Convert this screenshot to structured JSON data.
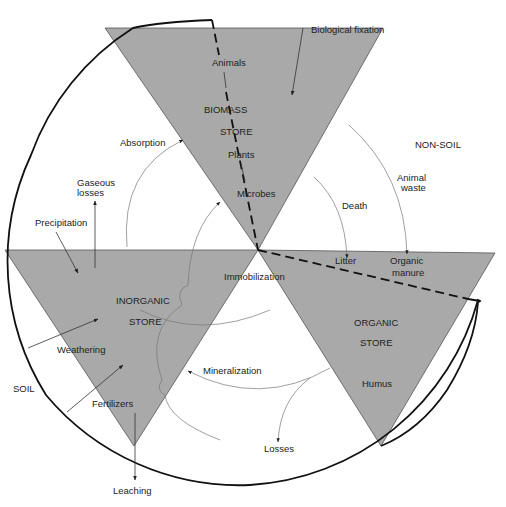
{
  "diagram": {
    "regions": {
      "soil": "SOIL",
      "non_soil": "NON-SOIL"
    },
    "stores": {
      "biomass": {
        "title_line1": "BIOMASS",
        "title_line2": "STORE",
        "components": [
          "Animals",
          "Plants",
          "Microbes"
        ]
      },
      "inorganic": {
        "title_line1": "INORGANIC",
        "title_line2": "STORE"
      },
      "organic": {
        "title_line1": "ORGANIC",
        "title_line2": "STORE",
        "components": [
          "Litter",
          "Organic",
          "manure",
          "Humus"
        ]
      }
    },
    "flows": {
      "biological_fixation": "Biological fixation",
      "absorption": "Absorption",
      "gaseous_losses_1": "Gaseous",
      "gaseous_losses_2": "losses",
      "precipitation": "Precipitation",
      "death": "Death",
      "animal_waste_1": "Animal",
      "animal_waste_2": "waste",
      "immobilization": "Immobilization",
      "weathering": "Weathering",
      "fertilizers": "Fertilizers",
      "mineralization": "Mineralization",
      "losses": "Losses",
      "leaching": "Leaching"
    },
    "colors": {
      "store_fill": "#a9a9a9",
      "boundary": "#111111"
    }
  }
}
